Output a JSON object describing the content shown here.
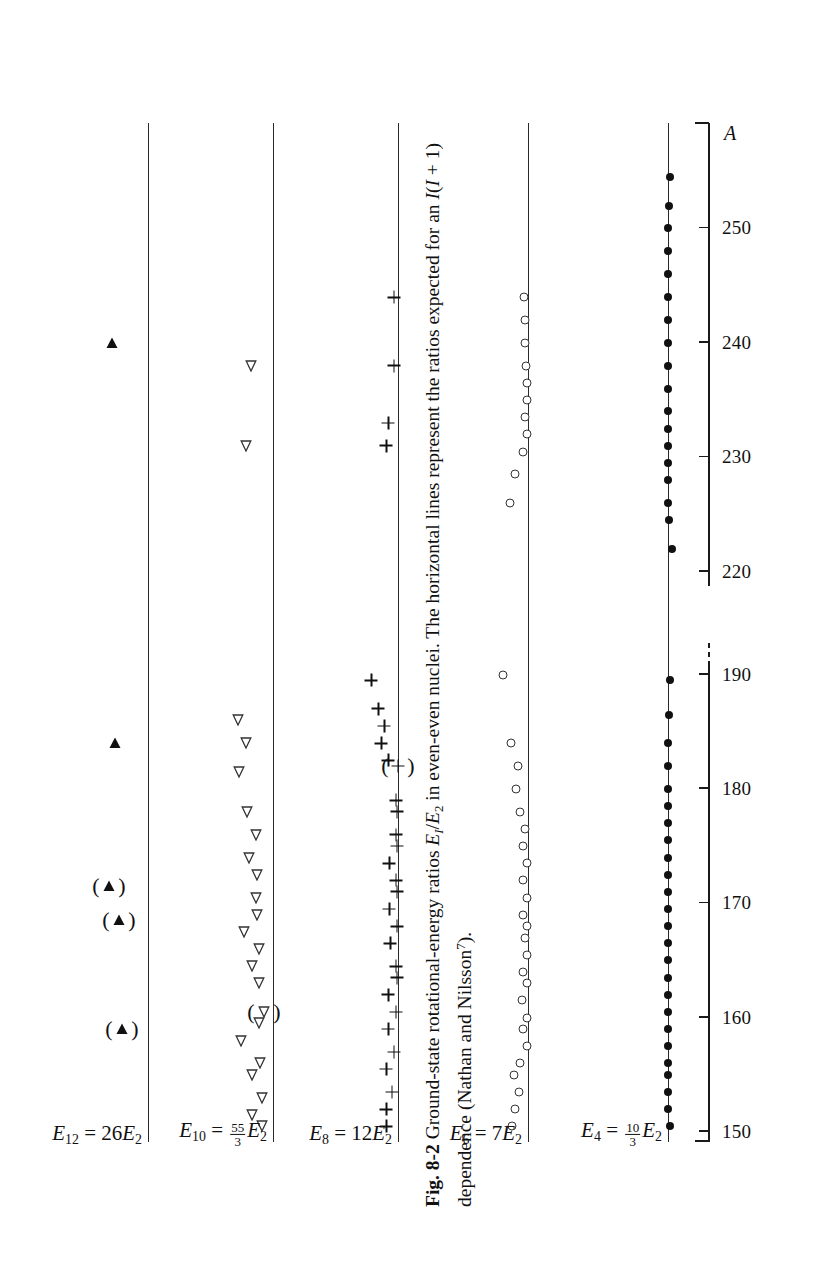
{
  "figure": {
    "label": "Fig. 8-2",
    "caption_part1": "Ground-state rotational-energy ratios ",
    "caption_ratio_num": "E",
    "caption_ratio_num_sub": "I",
    "caption_ratio_den": "E",
    "caption_ratio_den_sub": "2",
    "caption_part2": " in even-even nuclei. The horizontal lines represent the ratios expected for an ",
    "caption_dep_I": "I",
    "caption_dep_open": "(",
    "caption_dep_inner": "I",
    "caption_dep_plus": " + 1)",
    "caption_part3": " dependence (Nathan and Nilsson",
    "caption_ref": "7",
    "caption_part4": ")."
  },
  "axis": {
    "name": "A",
    "ticks": [
      {
        "value": 150,
        "label": "150"
      },
      {
        "value": 160,
        "label": "160"
      },
      {
        "value": 170,
        "label": "170"
      },
      {
        "value": 180,
        "label": "180"
      },
      {
        "value": 190,
        "label": "190"
      },
      {
        "value": 220,
        "label": "220"
      },
      {
        "value": 230,
        "label": "230"
      },
      {
        "value": 240,
        "label": "240"
      },
      {
        "value": 250,
        "label": "250"
      }
    ],
    "break_between": [
      190,
      220
    ],
    "range": [
      150,
      258
    ]
  },
  "levels": [
    {
      "id": "E4",
      "symbol": "E",
      "sub": "4",
      "equals": "=",
      "coefficient_type": "fraction",
      "num": "10",
      "den": "3",
      "rhs_symbol": "E",
      "rhs_sub": "2",
      "value": 3.333,
      "marker": "filled-circle"
    },
    {
      "id": "E6",
      "symbol": "E",
      "sub": "6",
      "equals": "=",
      "coefficient_type": "integer",
      "coefficient": "7",
      "rhs_symbol": "E",
      "rhs_sub": "2",
      "value": 7,
      "marker": "open-circle"
    },
    {
      "id": "E8",
      "symbol": "E",
      "sub": "8",
      "equals": "=",
      "coefficient_type": "integer",
      "coefficient": "12",
      "rhs_symbol": "E",
      "rhs_sub": "2",
      "value": 12,
      "marker": "plus"
    },
    {
      "id": "E10",
      "symbol": "E",
      "sub": "10",
      "equals": "=",
      "coefficient_type": "fraction",
      "num": "55",
      "den": "3",
      "rhs_symbol": "E",
      "rhs_sub": "2",
      "value": 18.333,
      "marker": "open-triangle"
    },
    {
      "id": "E12",
      "symbol": "E",
      "sub": "12",
      "equals": "=",
      "coefficient_type": "integer",
      "coefficient": "26",
      "rhs_symbol": "E",
      "rhs_sub": "2",
      "value": 26,
      "marker": "filled-triangle"
    }
  ],
  "chart_data": {
    "type": "scatter",
    "xlabel": "A",
    "ylabel": "E_I / E_2",
    "xlim": [
      150,
      258
    ],
    "x_axis_break": [
      190,
      220
    ],
    "grid": false,
    "legend": "none",
    "reference_lines": [
      {
        "name": "E4 = 10/3 E2",
        "value": 3.333
      },
      {
        "name": "E6 = 7 E2",
        "value": 7
      },
      {
        "name": "E8 = 12 E2",
        "value": 12
      },
      {
        "name": "E10 = 55/3 E2",
        "value": 18.333
      },
      {
        "name": "E12 = 26 E2",
        "value": 26
      }
    ],
    "series": [
      {
        "name": "E4/E2",
        "marker": "filled-circle",
        "reference": 3.333,
        "points": [
          {
            "A": 150.5,
            "r": 3.29
          },
          {
            "A": 152.0,
            "r": 3.34
          },
          {
            "A": 153.5,
            "r": 3.34
          },
          {
            "A": 155.0,
            "r": 3.33
          },
          {
            "A": 156.0,
            "r": 3.33
          },
          {
            "A": 157.5,
            "r": 3.32
          },
          {
            "A": 159.0,
            "r": 3.34
          },
          {
            "A": 160.5,
            "r": 3.33
          },
          {
            "A": 162.0,
            "r": 3.33
          },
          {
            "A": 163.5,
            "r": 3.34
          },
          {
            "A": 165.0,
            "r": 3.33
          },
          {
            "A": 166.5,
            "r": 3.33
          },
          {
            "A": 168.0,
            "r": 3.33
          },
          {
            "A": 169.5,
            "r": 3.34
          },
          {
            "A": 171.0,
            "r": 3.33
          },
          {
            "A": 172.5,
            "r": 3.33
          },
          {
            "A": 174.0,
            "r": 3.33
          },
          {
            "A": 175.5,
            "r": 3.33
          },
          {
            "A": 177.0,
            "r": 3.33
          },
          {
            "A": 178.5,
            "r": 3.33
          },
          {
            "A": 180.0,
            "r": 3.34
          },
          {
            "A": 182.0,
            "r": 3.33
          },
          {
            "A": 184.0,
            "r": 3.32
          },
          {
            "A": 186.5,
            "r": 3.3
          },
          {
            "A": 189.5,
            "r": 3.28
          },
          {
            "A": 222.0,
            "r": 3.24
          },
          {
            "A": 224.5,
            "r": 3.3
          },
          {
            "A": 226.0,
            "r": 3.33
          },
          {
            "A": 228.0,
            "r": 3.33
          },
          {
            "A": 229.5,
            "r": 3.32
          },
          {
            "A": 231.0,
            "r": 3.33
          },
          {
            "A": 232.5,
            "r": 3.33
          },
          {
            "A": 234.0,
            "r": 3.33
          },
          {
            "A": 236.0,
            "r": 3.33
          },
          {
            "A": 238.0,
            "r": 3.33
          },
          {
            "A": 240.0,
            "r": 3.33
          },
          {
            "A": 242.0,
            "r": 3.33
          },
          {
            "A": 244.0,
            "r": 3.32
          },
          {
            "A": 246.0,
            "r": 3.33
          },
          {
            "A": 248.0,
            "r": 3.32
          },
          {
            "A": 250.0,
            "r": 3.32
          },
          {
            "A": 252.0,
            "r": 3.31
          },
          {
            "A": 254.5,
            "r": 3.29
          }
        ]
      },
      {
        "name": "E6/E2",
        "marker": "open-circle",
        "reference": 7.0,
        "points": [
          {
            "A": 150.5,
            "r": 7.6
          },
          {
            "A": 152.0,
            "r": 7.5
          },
          {
            "A": 153.5,
            "r": 7.35
          },
          {
            "A": 155.0,
            "r": 7.55
          },
          {
            "A": 156.0,
            "r": 7.3
          },
          {
            "A": 157.5,
            "r": 7.05
          },
          {
            "A": 159.0,
            "r": 7.2
          },
          {
            "A": 160.0,
            "r": 7.05
          },
          {
            "A": 161.5,
            "r": 7.25
          },
          {
            "A": 163.0,
            "r": 7.05
          },
          {
            "A": 164.0,
            "r": 7.2
          },
          {
            "A": 165.5,
            "r": 7.05
          },
          {
            "A": 167.0,
            "r": 7.1
          },
          {
            "A": 168.0,
            "r": 7.05
          },
          {
            "A": 169.0,
            "r": 7.2
          },
          {
            "A": 170.5,
            "r": 7.05
          },
          {
            "A": 172.0,
            "r": 7.2
          },
          {
            "A": 173.5,
            "r": 7.05
          },
          {
            "A": 175.0,
            "r": 7.2
          },
          {
            "A": 176.5,
            "r": 7.1
          },
          {
            "A": 178.0,
            "r": 7.3
          },
          {
            "A": 180.0,
            "r": 7.45
          },
          {
            "A": 182.0,
            "r": 7.4
          },
          {
            "A": 184.0,
            "r": 7.65
          },
          {
            "A": 190.0,
            "r": 7.95
          },
          {
            "A": 226.0,
            "r": 7.7
          },
          {
            "A": 228.5,
            "r": 7.5
          },
          {
            "A": 230.5,
            "r": 7.2
          },
          {
            "A": 232.0,
            "r": 7.05
          },
          {
            "A": 233.5,
            "r": 7.12
          },
          {
            "A": 235.0,
            "r": 7.05
          },
          {
            "A": 236.5,
            "r": 7.02
          },
          {
            "A": 238.0,
            "r": 7.08
          },
          {
            "A": 240.0,
            "r": 7.1
          },
          {
            "A": 242.0,
            "r": 7.1
          },
          {
            "A": 244.0,
            "r": 7.15
          }
        ]
      },
      {
        "name": "E8/E2",
        "marker": "plus",
        "reference": 12.0,
        "parenthesised": [
          {
            "A": 182.0,
            "r": 12.0
          }
        ],
        "points": [
          {
            "A": 150.5,
            "r": 12.6
          },
          {
            "A": 152.0,
            "r": 12.6
          },
          {
            "A": 153.5,
            "r": 12.3
          },
          {
            "A": 155.5,
            "r": 12.6
          },
          {
            "A": 157.0,
            "r": 12.2
          },
          {
            "A": 159.0,
            "r": 12.5
          },
          {
            "A": 160.5,
            "r": 12.1
          },
          {
            "A": 162.0,
            "r": 12.5
          },
          {
            "A": 163.5,
            "r": 12.05
          },
          {
            "A": 164.5,
            "r": 12.1
          },
          {
            "A": 166.5,
            "r": 12.4
          },
          {
            "A": 168.0,
            "r": 12.05
          },
          {
            "A": 169.5,
            "r": 12.45
          },
          {
            "A": 171.0,
            "r": 12.05
          },
          {
            "A": 172.0,
            "r": 12.1
          },
          {
            "A": 173.5,
            "r": 12.45
          },
          {
            "A": 175.0,
            "r": 12.05
          },
          {
            "A": 176.0,
            "r": 12.1
          },
          {
            "A": 178.0,
            "r": 12.05
          },
          {
            "A": 179.0,
            "r": 12.1
          },
          {
            "A": 182.5,
            "r": 12.5
          },
          {
            "A": 184.0,
            "r": 12.85
          },
          {
            "A": 185.5,
            "r": 12.7
          },
          {
            "A": 187.0,
            "r": 13.0
          },
          {
            "A": 189.5,
            "r": 13.35
          },
          {
            "A": 231.0,
            "r": 12.6
          },
          {
            "A": 233.0,
            "r": 12.5
          },
          {
            "A": 238.0,
            "r": 12.2
          },
          {
            "A": 244.0,
            "r": 12.2
          }
        ]
      },
      {
        "name": "E10/E2",
        "marker": "open-triangle",
        "reference": 18.333,
        "parenthesised": [
          {
            "A": 160.5,
            "r": 18.9
          }
        ],
        "points": [
          {
            "A": 150.5,
            "r": 19.0
          },
          {
            "A": 151.5,
            "r": 19.6
          },
          {
            "A": 153.0,
            "r": 19.0
          },
          {
            "A": 155.0,
            "r": 19.6
          },
          {
            "A": 156.0,
            "r": 19.1
          },
          {
            "A": 158.0,
            "r": 20.3
          },
          {
            "A": 159.5,
            "r": 19.2
          },
          {
            "A": 163.0,
            "r": 19.2
          },
          {
            "A": 164.5,
            "r": 19.6
          },
          {
            "A": 166.0,
            "r": 19.2
          },
          {
            "A": 167.5,
            "r": 20.1
          },
          {
            "A": 169.0,
            "r": 19.3
          },
          {
            "A": 170.5,
            "r": 19.4
          },
          {
            "A": 172.5,
            "r": 19.3
          },
          {
            "A": 174.0,
            "r": 19.8
          },
          {
            "A": 176.0,
            "r": 19.4
          },
          {
            "A": 178.0,
            "r": 19.9
          },
          {
            "A": 181.5,
            "r": 20.4
          },
          {
            "A": 184.0,
            "r": 20.0
          },
          {
            "A": 186.0,
            "r": 20.5
          },
          {
            "A": 231.0,
            "r": 20.0
          },
          {
            "A": 238.0,
            "r": 19.7
          }
        ]
      },
      {
        "name": "E12/E2",
        "marker": "filled-triangle",
        "reference": 26.0,
        "parenthesised": [
          {
            "A": 159.0,
            "r": 27.6
          },
          {
            "A": 168.5,
            "r": 27.8
          },
          {
            "A": 171.5,
            "r": 28.4
          }
        ],
        "points": [
          {
            "A": 184.0,
            "r": 28.0
          },
          {
            "A": 240.0,
            "r": 28.2
          }
        ]
      }
    ]
  }
}
